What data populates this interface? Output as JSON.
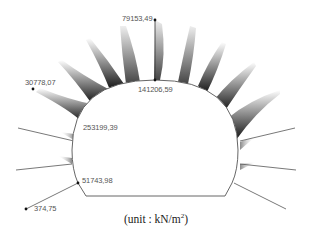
{
  "diagram": {
    "type": "tunnel lining stress distribution",
    "unit_label": "(unit : kN/m",
    "unit_sup": "2",
    "unit_close": ")",
    "labels": [
      {
        "id": "crown-outer",
        "text": "79153,49",
        "x": 120,
        "y": 16
      },
      {
        "id": "crown-inner",
        "text": "141206,59",
        "x": 138,
        "y": 86
      },
      {
        "id": "shoulder-outer",
        "text": "30778,07",
        "x": 24,
        "y": 78
      },
      {
        "id": "shoulder-inner",
        "text": "253199,39",
        "x": 83,
        "y": 122
      },
      {
        "id": "invert-corner-inner",
        "text": "51743,98",
        "x": 82,
        "y": 176
      },
      {
        "id": "invert-corner-outer",
        "text": "374,75",
        "x": 34,
        "y": 204
      }
    ],
    "colors": {
      "outline": "#555555",
      "petal_dark": "#111111",
      "petal_light": "#ffffff",
      "label": "#555555"
    }
  }
}
